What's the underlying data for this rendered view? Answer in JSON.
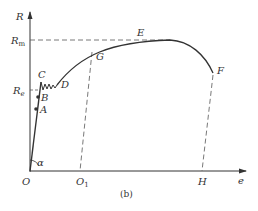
{
  "diagram": {
    "type": "stress-strain curve",
    "caption": "(b)",
    "axes": {
      "y_label": "R",
      "x_label": "e",
      "origin_label": "O"
    },
    "y_levels": {
      "Rm": "R",
      "Rm_sub": "m",
      "Re": "R",
      "Re_sub": "e"
    },
    "points": {
      "A": "A",
      "B": "B",
      "C": "C",
      "D": "D",
      "E": "E",
      "F": "F",
      "G": "G",
      "O1": "O",
      "O1_sub": "1",
      "H": "H"
    },
    "angle_label": "α",
    "colors": {
      "line": "#333333",
      "dashed": "#555555"
    }
  }
}
